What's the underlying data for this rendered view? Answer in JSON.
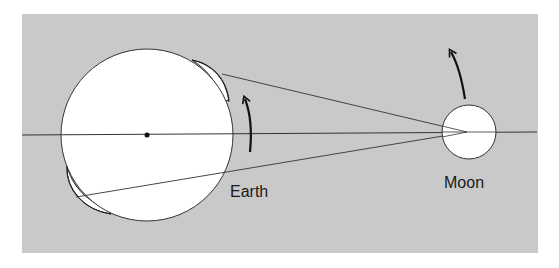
{
  "diagram": {
    "type": "tidal-bulge-earth-moon",
    "background_color": "#c9c9c9",
    "page_color": "#ffffff",
    "line_color": "#222222",
    "bodies": {
      "earth": {
        "label": "Earth",
        "center": [
          147,
          134
        ],
        "radius": 86,
        "fill": "#ffffff"
      },
      "moon": {
        "label": "Moon",
        "center": [
          469,
          132
        ],
        "radius": 27,
        "fill": "#ffffff"
      }
    },
    "labels": {
      "earth": "Earth",
      "moon": "Moon"
    },
    "arrows": {
      "earth_rotation": "counterclockwise rotation arrow near Earth's right limb",
      "moon_orbit": "orbital motion arrow above Moon"
    }
  }
}
